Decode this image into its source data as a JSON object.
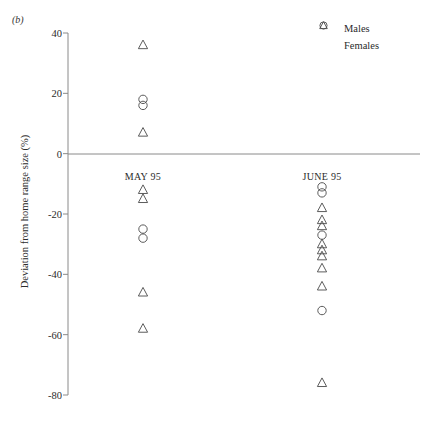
{
  "panel": {
    "label": "(b)"
  },
  "legend": {
    "position": "top-right",
    "items": [
      {
        "label": "Males",
        "marker": "circle-icon"
      },
      {
        "label": "Females",
        "marker": "triangle-icon"
      }
    ]
  },
  "axis": {
    "ylabel": "Deviation from home range size (%)",
    "yticks": [
      "40",
      "20",
      "0",
      "-20",
      "-40",
      "-60",
      "-80"
    ],
    "ytickvalues": [
      40,
      20,
      0,
      -20,
      -40,
      -60,
      -80
    ],
    "ylim": [
      -80,
      40
    ],
    "zero_line": true,
    "grid": false
  },
  "groups": [
    {
      "label": "MAY 95",
      "x": 143,
      "label_y": 176
    },
    {
      "label": "JUNE 95",
      "x": 322,
      "label_y": 176
    }
  ],
  "chart_data": {
    "type": "scatter",
    "title": "",
    "xlabel": "",
    "ylabel": "Deviation from home range size (%)",
    "ylim": [
      -80,
      40
    ],
    "grid": false,
    "legend_position": "top-right",
    "categories": [
      "MAY 95",
      "JUNE 95"
    ],
    "series": [
      {
        "name": "Males",
        "marker": "circle",
        "points": [
          {
            "group": "MAY 95",
            "value": 18
          },
          {
            "group": "MAY 95",
            "value": 16
          },
          {
            "group": "MAY 95",
            "value": -25
          },
          {
            "group": "MAY 95",
            "value": -28
          },
          {
            "group": "JUNE 95",
            "value": -11
          },
          {
            "group": "JUNE 95",
            "value": -13
          },
          {
            "group": "JUNE 95",
            "value": -27
          },
          {
            "group": "JUNE 95",
            "value": -52
          }
        ]
      },
      {
        "name": "Females",
        "marker": "triangle",
        "points": [
          {
            "group": "MAY 95",
            "value": 36
          },
          {
            "group": "MAY 95",
            "value": 7
          },
          {
            "group": "MAY 95",
            "value": -12
          },
          {
            "group": "MAY 95",
            "value": -15
          },
          {
            "group": "MAY 95",
            "value": -46
          },
          {
            "group": "MAY 95",
            "value": -58
          },
          {
            "group": "JUNE 95",
            "value": -18
          },
          {
            "group": "JUNE 95",
            "value": -22
          },
          {
            "group": "JUNE 95",
            "value": -24
          },
          {
            "group": "JUNE 95",
            "value": -30
          },
          {
            "group": "JUNE 95",
            "value": -32
          },
          {
            "group": "JUNE 95",
            "value": -34
          },
          {
            "group": "JUNE 95",
            "value": -38
          },
          {
            "group": "JUNE 95",
            "value": -44
          },
          {
            "group": "JUNE 95",
            "value": -76
          }
        ]
      }
    ]
  },
  "colors": {
    "marker": "#4a4a4a",
    "axis": "#8a8a8a",
    "text": "#2b2b2b"
  }
}
